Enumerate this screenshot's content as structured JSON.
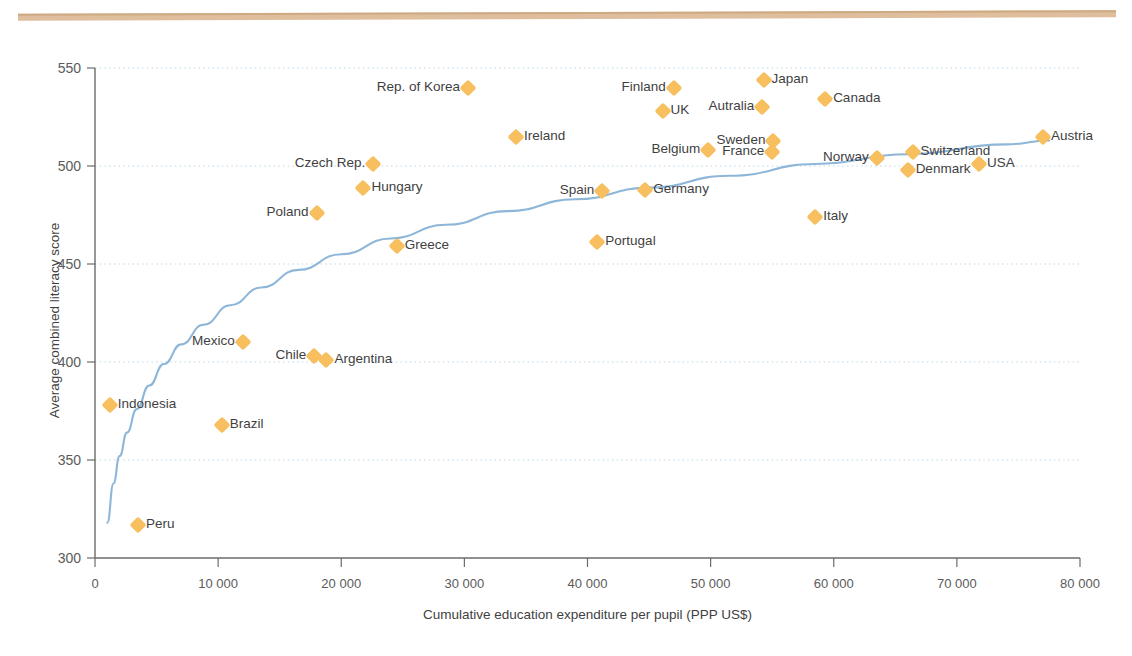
{
  "figure": {
    "clipped_header_text": "",
    "accent_rule_color": "#dbb894",
    "marker_color": "#f7bf5e",
    "trendline_color": "#8db6d8",
    "gridline_color": "#bcd7e8",
    "axis_color": "#5b5b5b"
  },
  "chart_data": {
    "type": "scatter",
    "title": "",
    "xlabel": "Cumulative education expenditure per pupil (PPP US$)",
    "ylabel": "Average combined literacy score",
    "xlim": [
      0,
      80000
    ],
    "ylim": [
      300,
      550
    ],
    "xticks": [
      0,
      10000,
      20000,
      30000,
      40000,
      50000,
      60000,
      70000,
      80000
    ],
    "xtick_labels": [
      "0",
      "10 000",
      "20 000",
      "30 000",
      "40 000",
      "50 000",
      "60 000",
      "70 000",
      "80 000"
    ],
    "yticks": [
      300,
      350,
      400,
      450,
      500,
      550
    ],
    "ytick_labels": [
      "300",
      "350",
      "400",
      "450",
      "500",
      "550"
    ],
    "grid": "horizontal-dotted",
    "legend": "none",
    "trendline": {
      "label": "logarithmic fit",
      "points": [
        [
          1000,
          318
        ],
        [
          1500,
          338
        ],
        [
          2000,
          352
        ],
        [
          2600,
          364
        ],
        [
          3400,
          376
        ],
        [
          4400,
          388
        ],
        [
          5600,
          399
        ],
        [
          7000,
          409
        ],
        [
          8800,
          419
        ],
        [
          11000,
          429
        ],
        [
          13500,
          438
        ],
        [
          16500,
          447
        ],
        [
          20000,
          455
        ],
        [
          24000,
          463
        ],
        [
          28500,
          470
        ],
        [
          33500,
          477
        ],
        [
          39000,
          483
        ],
        [
          45000,
          489
        ],
        [
          51500,
          495
        ],
        [
          58500,
          501
        ],
        [
          66000,
          506
        ],
        [
          74000,
          511
        ],
        [
          77500,
          513
        ]
      ]
    },
    "points": [
      {
        "name": "Indonesia",
        "x": 1200,
        "y": 378,
        "label_side": "right"
      },
      {
        "name": "Peru",
        "x": 3500,
        "y": 317,
        "label_side": "right"
      },
      {
        "name": "Brazil",
        "x": 10300,
        "y": 368,
        "label_side": "right"
      },
      {
        "name": "Mexico",
        "x": 12000,
        "y": 410,
        "label_side": "left"
      },
      {
        "name": "Chile",
        "x": 17800,
        "y": 403,
        "label_side": "left"
      },
      {
        "name": "Argentina",
        "x": 18800,
        "y": 401,
        "label_side": "right"
      },
      {
        "name": "Poland",
        "x": 18000,
        "y": 476,
        "label_side": "left"
      },
      {
        "name": "Hungary",
        "x": 21800,
        "y": 489,
        "label_side": "right"
      },
      {
        "name": "Czech Rep.",
        "x": 22600,
        "y": 501,
        "label_side": "left"
      },
      {
        "name": "Greece",
        "x": 24500,
        "y": 459,
        "label_side": "right"
      },
      {
        "name": "Rep. of Korea",
        "x": 30300,
        "y": 540,
        "label_side": "left"
      },
      {
        "name": "Ireland",
        "x": 34200,
        "y": 515,
        "label_side": "right"
      },
      {
        "name": "Portugal",
        "x": 40800,
        "y": 461,
        "label_side": "right"
      },
      {
        "name": "Spain",
        "x": 41200,
        "y": 487,
        "label_side": "left"
      },
      {
        "name": "Germany",
        "x": 44700,
        "y": 488,
        "label_side": "right"
      },
      {
        "name": "Finland",
        "x": 47000,
        "y": 540,
        "label_side": "left"
      },
      {
        "name": "UK",
        "x": 46100,
        "y": 528,
        "label_side": "right"
      },
      {
        "name": "Belgium",
        "x": 49800,
        "y": 508,
        "label_side": "left"
      },
      {
        "name": "Autralia",
        "x": 54200,
        "y": 530,
        "label_side": "left"
      },
      {
        "name": "Japan",
        "x": 54300,
        "y": 544,
        "label_side": "right"
      },
      {
        "name": "Sweden",
        "x": 55100,
        "y": 513,
        "label_side": "left"
      },
      {
        "name": "France",
        "x": 55000,
        "y": 507,
        "label_side": "left"
      },
      {
        "name": "Italy",
        "x": 58500,
        "y": 474,
        "label_side": "right"
      },
      {
        "name": "Canada",
        "x": 59300,
        "y": 534,
        "label_side": "right"
      },
      {
        "name": "Norway",
        "x": 63500,
        "y": 504,
        "label_side": "left"
      },
      {
        "name": "Denmark",
        "x": 66000,
        "y": 498,
        "label_side": "right"
      },
      {
        "name": "Switzerland",
        "x": 66400,
        "y": 507,
        "label_side": "right"
      },
      {
        "name": "USA",
        "x": 71800,
        "y": 501,
        "label_side": "right"
      },
      {
        "name": "Austria",
        "x": 77000,
        "y": 515,
        "label_side": "right"
      }
    ]
  }
}
